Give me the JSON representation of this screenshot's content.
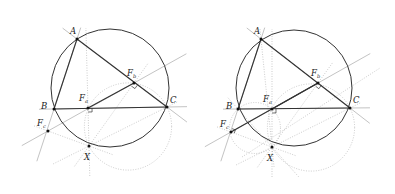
{
  "figures": [
    {
      "id": "left",
      "points": {
        "A": {
          "label": "A",
          "x": 77,
          "y": 39,
          "lx": 70,
          "ly": 34
        },
        "B": {
          "label": "B",
          "x": 54,
          "y": 109,
          "lx": 41,
          "ly": 109
        },
        "C": {
          "label": "C",
          "x": 167,
          "y": 107,
          "lx": 170,
          "ly": 103
        },
        "Fa": {
          "label": "F",
          "sub": "a",
          "x": 88,
          "y": 108,
          "lx": 79,
          "ly": 101
        },
        "Fb": {
          "label": "F",
          "sub": "b",
          "x": 134,
          "y": 83,
          "lx": 127,
          "ly": 76
        },
        "Fc": {
          "label": "F",
          "sub": "c",
          "x": 48,
          "y": 131,
          "lx": 37,
          "ly": 126
        },
        "X": {
          "label": "X",
          "x": 89,
          "y": 146,
          "lx": 84,
          "ly": 160
        }
      },
      "circumcircle": {
        "cx": 110,
        "cy": 88,
        "r": 59
      },
      "simson_segment": [
        "Fa",
        "Fb"
      ],
      "extra_segment": null
    },
    {
      "id": "right",
      "points": {
        "A": {
          "label": "A",
          "x": 261,
          "y": 39,
          "lx": 254,
          "ly": 34
        },
        "B": {
          "label": "B",
          "x": 238,
          "y": 109,
          "lx": 226,
          "ly": 109
        },
        "C": {
          "label": "C",
          "x": 350,
          "y": 108,
          "lx": 353,
          "ly": 103
        },
        "Fa": {
          "label": "F",
          "sub": "a",
          "x": 272,
          "y": 109,
          "lx": 263,
          "ly": 102
        },
        "Fb": {
          "label": "F",
          "sub": "b",
          "x": 318,
          "y": 83,
          "lx": 311,
          "ly": 76
        },
        "Fc": {
          "label": "F",
          "sub": "c",
          "x": 231,
          "y": 132,
          "lx": 220,
          "ly": 127
        },
        "X": {
          "label": "X",
          "x": 272,
          "y": 147,
          "lx": 267,
          "ly": 161
        }
      },
      "circumcircle": {
        "cx": 294,
        "cy": 88,
        "r": 58
      },
      "simson_segment": [
        "Fc",
        "Fb"
      ],
      "extra_segment": true
    }
  ],
  "colors": {
    "line": "#333333",
    "thin": "#9a9a9a",
    "dotted": "#aaaaaa",
    "point": "#111111"
  }
}
